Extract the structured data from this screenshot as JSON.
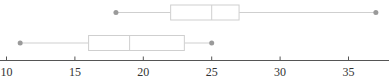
{
  "chart_data": {
    "type": "boxplot",
    "orientation": "horizontal",
    "title": "",
    "xlabel": "",
    "ylabel": "",
    "xlim": [
      10,
      38
    ],
    "grid": false,
    "legend": "none",
    "xticks": [
      10,
      15,
      20,
      25,
      30,
      35
    ],
    "xtick_labels": [
      "10",
      "15",
      "20",
      "25",
      "30",
      "35"
    ],
    "series": [
      {
        "name": "upper",
        "min": 18,
        "q1": 22,
        "median": 25,
        "q3": 27,
        "max": 37
      },
      {
        "name": "lower",
        "min": 11,
        "q1": 16,
        "median": 19,
        "q3": 23,
        "max": 25
      }
    ],
    "colors": {
      "box_stroke": "#cfcfcf",
      "endpoint": "#9a9a9a",
      "axis": "#555555"
    }
  }
}
